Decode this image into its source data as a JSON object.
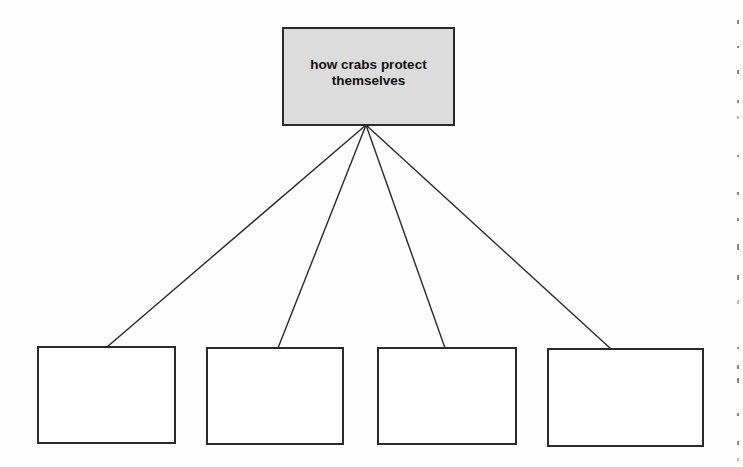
{
  "diagram": {
    "type": "tree",
    "root": {
      "label": "how crabs protect themselves",
      "fill": "#dcdcdc"
    },
    "children": [
      {
        "label": ""
      },
      {
        "label": ""
      },
      {
        "label": ""
      },
      {
        "label": ""
      }
    ],
    "colors": {
      "background": "#fdfdfd",
      "stroke": "#2a2a2a",
      "child_fill": "#ffffff"
    }
  }
}
